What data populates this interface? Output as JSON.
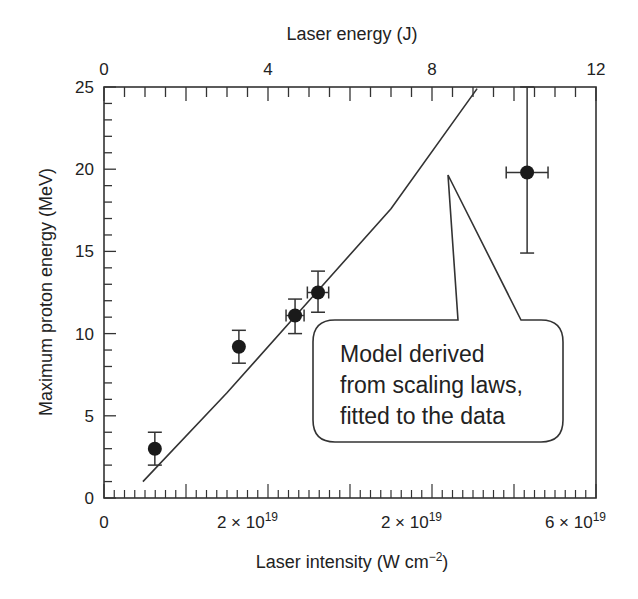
{
  "chart_data": {
    "type": "scatter",
    "title": "",
    "xlabel": "Laser intensity (W cm⁻²)",
    "xlabel_main": "Laser intensity (W cm",
    "xlabel_sup": "−2",
    "xlabel_close": ")",
    "x2label": "Laser energy (J)",
    "ylabel": "Maximum proton energy (MeV)",
    "xlim_energy_J": [
      0,
      12
    ],
    "ylim": [
      0,
      25
    ],
    "grid": false,
    "yticks": [
      0,
      5,
      10,
      15,
      20,
      25
    ],
    "top_ticks": [
      0,
      4,
      8,
      12
    ],
    "bottom_tick_labels": [
      {
        "pos_J": 0,
        "base": "0",
        "exp": ""
      },
      {
        "pos_J": 3.5,
        "base": "2 × 10",
        "exp": "19"
      },
      {
        "pos_J": 7.5,
        "base": "2 × 10",
        "exp": "19"
      },
      {
        "pos_J": 11.5,
        "base": "6 × 10",
        "exp": "19"
      }
    ],
    "series": [
      {
        "name": "Measured data",
        "marker": "filled-circle",
        "points": [
          {
            "x_J": 1.24,
            "y": 3.0,
            "y_err_low": 2.0,
            "y_err_high": 4.0,
            "x_err": 0
          },
          {
            "x_J": 3.29,
            "y": 9.2,
            "y_err_low": 8.2,
            "y_err_high": 10.2,
            "x_err": 0
          },
          {
            "x_J": 4.66,
            "y": 11.1,
            "y_err_low": 10.0,
            "y_err_high": 12.1,
            "x_err": 0.22
          },
          {
            "x_J": 5.22,
            "y": 12.5,
            "y_err_low": 11.3,
            "y_err_high": 13.8,
            "x_err": 0.26
          },
          {
            "x_J": 10.32,
            "y": 19.8,
            "y_err_low": 14.9,
            "y_err_high": 25.0,
            "x_err": 0.51
          }
        ]
      },
      {
        "name": "Model",
        "type": "line",
        "points": [
          {
            "x_J": 0.95,
            "y": 1.0
          },
          {
            "x_J": 3.0,
            "y": 6.4
          },
          {
            "x_J": 5.0,
            "y": 12.0
          },
          {
            "x_J": 7.0,
            "y": 17.6
          },
          {
            "x_J": 9.1,
            "y": 24.9
          }
        ]
      }
    ],
    "annotation": {
      "lines": [
        "Model derived",
        "from scaling laws,",
        "fitted to the data"
      ]
    }
  }
}
